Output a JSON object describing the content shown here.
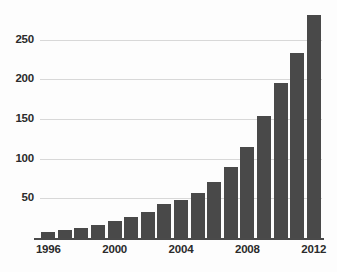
{
  "chart_data": {
    "type": "bar",
    "title": "",
    "subtitle": "",
    "xlabel": "",
    "ylabel": "",
    "categories": [
      "1996",
      "1997",
      "1998",
      "1999",
      "2000",
      "2001",
      "2002",
      "2003",
      "2004",
      "2005",
      "2006",
      "2007",
      "2008",
      "2009",
      "2010",
      "2011",
      "2012"
    ],
    "values": [
      8,
      10,
      13,
      17,
      22,
      27,
      33,
      43,
      48,
      57,
      71,
      89,
      115,
      154,
      195,
      233,
      281
    ],
    "x_tick_labels": [
      "1996",
      "2000",
      "2004",
      "2008",
      "2012"
    ],
    "x_tick_categories": [
      "1996",
      "2000",
      "2004",
      "2008",
      "2012"
    ],
    "y_tick_labels": [
      "50",
      "100",
      "150",
      "200",
      "250"
    ],
    "y_tick_values": [
      50,
      100,
      150,
      200,
      250
    ],
    "ylim": [
      0,
      290
    ],
    "xlim_categories": [
      "1996",
      "2012"
    ],
    "grid": true,
    "grid_axis": "y",
    "legend": false,
    "legend_position": "none",
    "bar_color": "#494949",
    "grid_color": "#d8d8d8",
    "axis_color": "#4a4a4a",
    "label_color": "#2b2b2b",
    "background_color": "#fdfdfd"
  },
  "ticks": {
    "y": [
      {
        "label": "250",
        "value": 250
      },
      {
        "label": "200",
        "value": 200
      },
      {
        "label": "150",
        "value": 150
      },
      {
        "label": "100",
        "value": 100
      },
      {
        "label": "50",
        "value": 50
      }
    ],
    "x": [
      {
        "label": "1996",
        "value": 1996
      },
      {
        "label": "2000",
        "value": 2000
      },
      {
        "label": "2004",
        "value": 2004
      },
      {
        "label": "2008",
        "value": 2008
      },
      {
        "label": "2012",
        "value": 2012
      }
    ]
  }
}
